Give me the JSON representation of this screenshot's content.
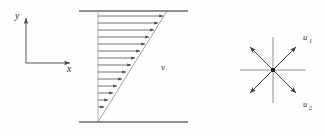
{
  "figure": {
    "background_color": "#fefefe",
    "line_color": "#555555",
    "arrow_color": "#3a3a3a",
    "plate_color": "#6b6b6b",
    "text_color": "#2b2b2b"
  },
  "axes_key": {
    "name": "coordinate-axes",
    "x_label": "x",
    "y_label": "y",
    "origin": {
      "x": 26,
      "y": 63
    },
    "x_tip": {
      "x": 72,
      "y": 63
    },
    "y_tip": {
      "x": 26,
      "y": 17
    }
  },
  "flow_diagram": {
    "name": "couette-flow-profile",
    "velocity_label": "v",
    "velocity_label_pos": {
      "x": 163,
      "y": 68
    },
    "top_plate": {
      "x1": 79,
      "y1": 11,
      "x2": 188,
      "y2": 11
    },
    "bottom_plate": {
      "x1": 79,
      "y1": 122,
      "x2": 188,
      "y2": 122
    },
    "wall_x": 98,
    "profile_top_x": 167,
    "profile_bottom_x": 98,
    "arrow_count": 14,
    "arrow_lengths_px": [
      68,
      64,
      59,
      54,
      49,
      44,
      39,
      34,
      29,
      24,
      19,
      14,
      9,
      5
    ],
    "arrow_rows_y": [
      16,
      23,
      30,
      37,
      44,
      51,
      58,
      65,
      72,
      79,
      86,
      93,
      100,
      107
    ]
  },
  "star_diagram": {
    "name": "stress-star-diagram",
    "center": {
      "x": 273,
      "y": 70
    },
    "radius": 33,
    "labels": [
      {
        "text": "u",
        "sub": "1",
        "x": 303,
        "y": 38
      },
      {
        "text": "u",
        "sub": "2",
        "x": 303,
        "y": 107
      }
    ],
    "ray_angles_deg": [
      0,
      45,
      90,
      135,
      180,
      225,
      270,
      315
    ],
    "arrow_rays_deg": [
      45,
      135,
      225,
      315
    ]
  }
}
